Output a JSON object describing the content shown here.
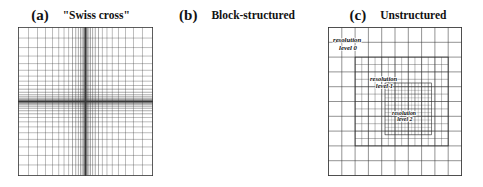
{
  "figure": {
    "background": "#ffffff",
    "line_color": "#3a3a3a",
    "text_color": "#121212"
  },
  "panels": [
    {
      "tag": "(a)",
      "title": "\"Swiss cross\"",
      "grid_type": "stretched-cartesian",
      "labels": []
    },
    {
      "tag": "(b)",
      "title": "Block-structured",
      "grid_type": "block-structured-amr",
      "labels": [
        {
          "line1": "resolution",
          "line2": "level 0"
        },
        {
          "line1": "resolution",
          "line2": "level 1"
        },
        {
          "line1": "resolution",
          "line2": "level 2"
        }
      ]
    },
    {
      "tag": "(c)",
      "title": "Unstructured",
      "grid_type": "unstructured-triangular",
      "labels": []
    }
  ],
  "chart_data": {
    "type": "diagram",
    "panel_count": 3,
    "panel_a": {
      "name": "Swiss cross",
      "description": "Structured Cartesian grid stretched so that lines cluster densely toward the centre in both x and y, forming a cross of high resolution.",
      "nx": 38,
      "ny": 40,
      "refinement": "continuous stretching",
      "clustering_center": [
        0.5,
        0.5
      ],
      "stretch_exponent": 3.0,
      "coarse_cells_per_side": 10
    },
    "panel_b": {
      "name": "Block-structured",
      "description": "Nested rectangular patches, each refined by a factor of two relative to its parent.",
      "base_grid": [
        10,
        10
      ],
      "levels": [
        {
          "level": 0,
          "label": "resolution level 0",
          "refinement_factor": 1,
          "extent": [
            0.0,
            0.0,
            1.0,
            1.0
          ]
        },
        {
          "level": 1,
          "label": "resolution level 1",
          "refinement_factor": 2,
          "extent": [
            0.2,
            0.2,
            0.9,
            0.8
          ]
        },
        {
          "level": 2,
          "label": "resolution level 2",
          "refinement_factor": 4,
          "extent": [
            0.42,
            0.38,
            0.78,
            0.72
          ]
        }
      ]
    },
    "panel_c": {
      "name": "Unstructured",
      "description": "Triangular unstructured mesh, coarse near the boundary and graded smoothly to a dense circular cluster of small triangles at the centre.",
      "element_type": "triangle",
      "coarse_edge_length": 0.14,
      "fine_edge_length": 0.028,
      "refined_region": {
        "shape": "rounded-square",
        "center": [
          0.5,
          0.5
        ],
        "radius": 0.3
      }
    }
  }
}
